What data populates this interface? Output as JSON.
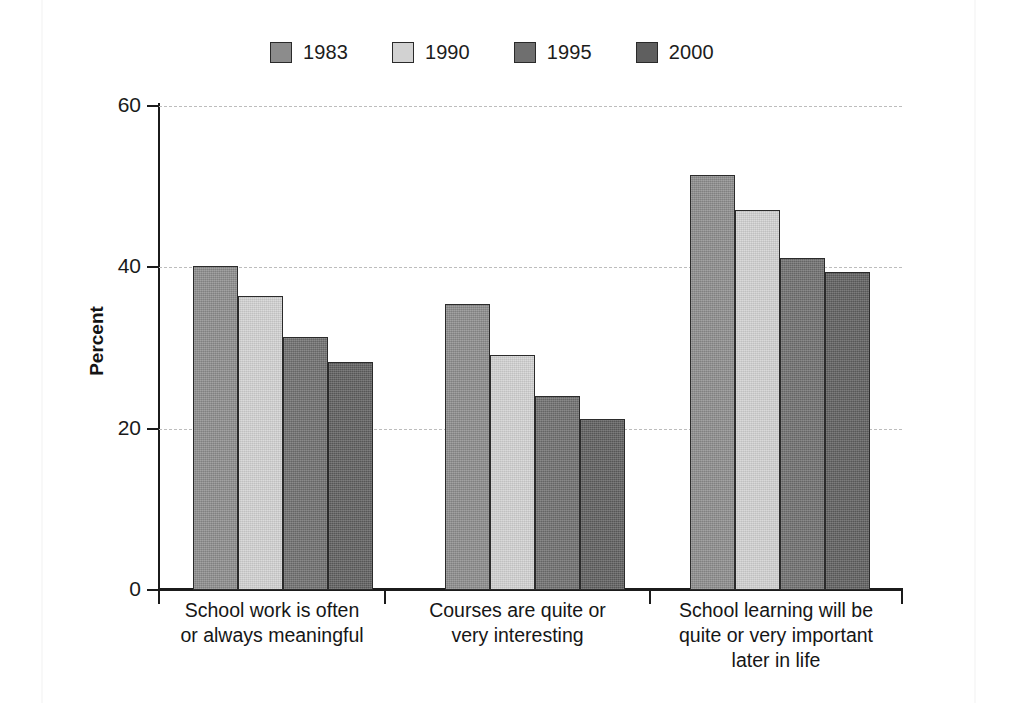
{
  "chart_data": {
    "type": "bar",
    "title": "",
    "subtitle": "",
    "xlabel": "",
    "ylabel": "Percent",
    "ylim": [
      0,
      60
    ],
    "yticks": [
      0,
      20,
      40,
      60
    ],
    "ytick_labels": [
      "0",
      "20",
      "40",
      "60"
    ],
    "grid": "horizontal-dashed",
    "legend_position": "top-center",
    "categories": [
      "School work is often or always meaningful",
      "Courses are quite or very interesting",
      "School learning will be quite or very important later in life"
    ],
    "category_lines": [
      [
        "School work is often",
        "or always meaningful"
      ],
      [
        "Courses are quite or",
        "very interesting"
      ],
      [
        "School learning will be",
        "quite or very important",
        "later in life"
      ]
    ],
    "series": [
      {
        "name": "1983",
        "color": "#8c8c8c",
        "values": [
          40.2,
          35.4,
          51.5
        ]
      },
      {
        "name": "1990",
        "color": "#d2d2d2",
        "values": [
          36.5,
          29.1,
          47.1
        ]
      },
      {
        "name": "1995",
        "color": "#6f6f6f",
        "values": [
          31.4,
          24.1,
          41.2
        ]
      },
      {
        "name": "2000",
        "color": "#5f5f5f",
        "values": [
          28.3,
          21.2,
          39.4
        ]
      }
    ]
  },
  "legend": {
    "items": [
      {
        "label": "1983",
        "color": "#8c8c8c"
      },
      {
        "label": "1990",
        "color": "#d2d2d2"
      },
      {
        "label": "1995",
        "color": "#6f6f6f"
      },
      {
        "label": "2000",
        "color": "#5f5f5f"
      }
    ]
  },
  "axes": {
    "y_label": "Percent",
    "y_tick_labels": [
      "60",
      "40",
      "20",
      "0"
    ]
  }
}
